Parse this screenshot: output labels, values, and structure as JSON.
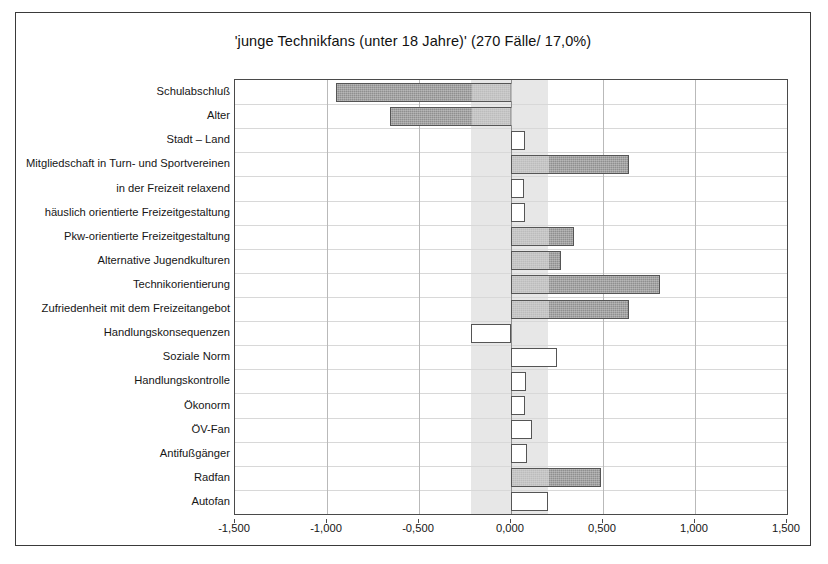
{
  "chart": {
    "title": "'junge Technikfans (unter 18 Jahre)' (270 Fälle/ 17,0%)"
  },
  "chart_data": {
    "type": "bar",
    "orientation": "horizontal",
    "title": "'junge Technikfans (unter 18 Jahre)' (270 Fälle/ 17,0%)",
    "xlabel": "",
    "ylabel": "",
    "xlim": [
      -1.5,
      1.5
    ],
    "xticks": [
      -1.5,
      -1.0,
      -0.5,
      0.0,
      0.5,
      1.0,
      1.5
    ],
    "xticklabels": [
      "-1,500",
      "-1,000",
      "-0,500",
      "0,000",
      "0,500",
      "1,000",
      "1,500"
    ],
    "grid": true,
    "legend": "none",
    "decimal_separator": ",",
    "shaded_band": [
      -0.22,
      0.2
    ],
    "categories": [
      "Schulabschluß",
      "Alter",
      "Stadt – Land",
      "Mitgliedschaft in Turn- und Sportvereinen",
      "in der Freizeit relaxend",
      "häuslich orientierte Freizeitgestaltung",
      "Pkw-orientierte Freizeitgestaltung",
      "Alternative Jugendkulturen",
      "Technikorientierung",
      "Zufriedenheit mit dem Freizeitangebot",
      "Handlungskonsequenzen",
      "Soziale Norm",
      "Handlungskontrolle",
      "Ökonorm",
      "ÖV-Fan",
      "Antifußgänger",
      "Radfan",
      "Autofan"
    ],
    "values": [
      -0.95,
      -0.66,
      0.075,
      0.64,
      0.07,
      0.075,
      0.34,
      0.27,
      0.81,
      0.64,
      -0.22,
      0.25,
      0.08,
      0.075,
      0.115,
      0.085,
      0.49,
      0.2
    ],
    "fills": [
      "dark",
      "dark",
      "light",
      "dark",
      "light",
      "light",
      "dark",
      "dark",
      "dark",
      "dark",
      "light",
      "light",
      "light",
      "light",
      "light",
      "light",
      "dark",
      "light"
    ],
    "colors": {
      "bar_dark": "#8f8f8f",
      "bar_light": "#ffffff",
      "bar_edge": "#555555",
      "band": "#e3e3e3",
      "grid": "#b9b9b9",
      "frame": "#4a4a4a"
    }
  }
}
